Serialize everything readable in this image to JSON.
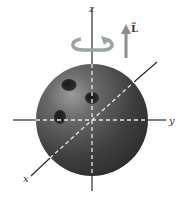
{
  "diagram": {
    "axes": {
      "x_label": "x",
      "y_label": "y",
      "z_label": "z"
    },
    "vector_label": "L",
    "vector_arrow_symbol": "→",
    "colors": {
      "ball": "#3c3c3c",
      "ball_highlight": "#8a8a8a",
      "axis": "#2a2a2a",
      "dashed_axis": "#e8e8e8",
      "rotation_arrow": "#9aa4a6",
      "L_arrow": "#8c8c8c"
    }
  }
}
